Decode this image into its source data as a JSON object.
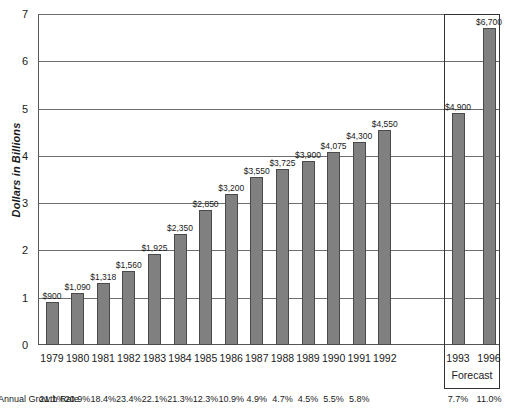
{
  "chart_data": {
    "type": "bar",
    "title": "",
    "xlabel": "",
    "ylabel": "Dollars in Billions",
    "ylim": [
      0,
      7
    ],
    "ytick_labels": [
      "0",
      "1",
      "2",
      "3",
      "4",
      "5",
      "6",
      "7"
    ],
    "grid": true,
    "legend": "none",
    "categories": [
      "1979",
      "1980",
      "1981",
      "1982",
      "1983",
      "1984",
      "1985",
      "1986",
      "1987",
      "1988",
      "1989",
      "1990",
      "1991",
      "1992",
      "1993",
      "1996"
    ],
    "values": [
      0.9,
      1.09,
      1.318,
      1.56,
      1.925,
      2.35,
      2.85,
      3.2,
      3.55,
      3.725,
      3.9,
      4.075,
      4.3,
      4.55,
      4.9,
      6.7
    ],
    "data_labels": [
      "$900",
      "$1,090",
      "$1,318",
      "$1,560",
      "$1,925",
      "$2,350",
      "$2,850",
      "$3,200",
      "$3,550",
      "$3,725",
      "$3,900",
      "$4,075",
      "$4,300",
      "$4,550",
      "$4,900",
      "$6,700"
    ],
    "annotations": {
      "growth_rate_label": "Annual Growth Rate",
      "growth_rates": [
        "21.1%",
        "20.9%",
        "18.4%",
        "23.4%",
        "22.1%",
        "21.3%",
        "12.3%",
        "10.9%",
        "4.9%",
        "4.7%",
        "4.5%",
        "5.5%",
        "5.8%",
        "",
        "7.7%",
        "11.0%"
      ],
      "forecast_caption": "Forecast",
      "forecast_categories": [
        "1993",
        "1996"
      ]
    },
    "colors": {
      "bar_fill": "#808080",
      "bar_border": "#4a4a4a",
      "gridline": "#6d6d6d",
      "axis": "#555555",
      "text": "#1a1a1a",
      "background": "#ffffff"
    }
  }
}
